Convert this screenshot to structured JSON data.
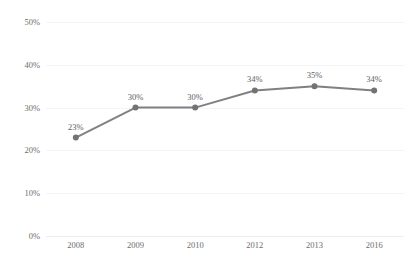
{
  "chart_data": {
    "type": "line",
    "title": "",
    "subtitle": "",
    "xlabel": "",
    "ylabel": "",
    "categories": [
      "2008",
      "2009",
      "2010",
      "2012",
      "2013",
      "2016"
    ],
    "values": [
      23,
      30,
      30,
      34,
      35,
      34
    ],
    "data_labels": [
      "23%",
      "30%",
      "30%",
      "34%",
      "35%",
      "34%"
    ],
    "ylim": [
      0,
      50
    ],
    "ytick_values": [
      0,
      10,
      20,
      30,
      40,
      50
    ],
    "ytick_labels": [
      "0%",
      "10%",
      "20%",
      "30%",
      "40%",
      "50%"
    ],
    "grid": true,
    "grid_axis": "y",
    "legend": false,
    "legend_position": "none",
    "series": [
      {
        "name": "Series 1",
        "values": [
          23,
          30,
          30,
          34,
          35,
          34
        ],
        "color": "#808080",
        "marker": "circle",
        "marker_color": "#737373",
        "line_width": 2
      }
    ]
  },
  "style": {
    "line_color": "#808080",
    "marker_color": "#737373",
    "gridline_color": "#f4f4f4",
    "baseline_color": "#ededed",
    "tick_label_color": "#6d6d6d",
    "data_label_color": "#5e5e5e",
    "background_color": "#ffffff"
  }
}
